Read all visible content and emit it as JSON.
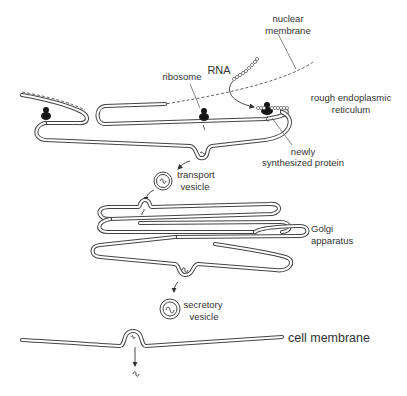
{
  "labels": {
    "nuclear_membrane": [
      "nuclear",
      "membrane"
    ],
    "rna": "RNA",
    "ribosome": "ribosome",
    "rough_er": [
      "rough endoplasmic",
      "reticulum"
    ],
    "newly_synthesized_protein": [
      "newly",
      "synthesized protein"
    ],
    "transport_vesicle": [
      "transport",
      "vesicle"
    ],
    "golgi_apparatus": [
      "Golgi",
      "apparatus"
    ],
    "secretory_vesicle": [
      "secretory",
      "vesicle"
    ],
    "cell_membrane": "cell membrane"
  },
  "colors": {
    "line": "#444444",
    "text": "#333333",
    "ribosome": "#151515",
    "background": "#ffffff"
  }
}
